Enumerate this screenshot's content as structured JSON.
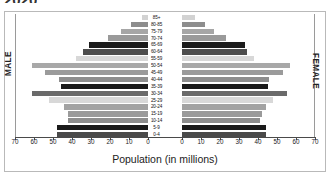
{
  "heading": "2020",
  "panel": {
    "male_label": "MALE",
    "female_label": "FEMALE",
    "x_title": "Population (in millions)"
  },
  "chart_data": {
    "type": "bar",
    "subtype": "population-pyramid",
    "title": "2020",
    "xlabel": "Population (in millions)",
    "ylabel": "",
    "xlim": [
      0,
      70
    ],
    "grid": false,
    "legend": false,
    "left_side_label": "MALE",
    "right_side_label": "FEMALE",
    "x_ticks_left": [
      70,
      60,
      50,
      40,
      30,
      20,
      10,
      0
    ],
    "x_ticks_right": [
      0,
      10,
      20,
      30,
      40,
      50,
      60,
      70
    ],
    "categories": [
      "85+",
      "80-85",
      "75-79",
      "70-74",
      "65-69",
      "60-64",
      "55-59",
      "50-54",
      "45-49",
      "40-44",
      "35-39",
      "30-34",
      "25-29",
      "20-24",
      "15-19",
      "10-14",
      "5-9",
      "0-4"
    ],
    "series": [
      {
        "name": "MALE",
        "side": "left",
        "values": [
          3,
          9,
          14,
          21,
          31,
          34,
          38,
          61,
          54,
          47,
          46,
          61,
          52,
          44,
          42,
          42,
          48,
          48
        ]
      },
      {
        "name": "FEMALE",
        "side": "right",
        "values": [
          7,
          12,
          17,
          23,
          33,
          34,
          38,
          57,
          53,
          46,
          45,
          55,
          48,
          44,
          42,
          41,
          44,
          44
        ]
      }
    ],
    "bar_shades": [
      "#d2d2d2",
      "#8d8d8d",
      "#a6a6a6",
      "#9a9a9a",
      "#1c1c1c",
      "#4e4e4e",
      "#d8d8d8",
      "#a8a8a8",
      "#9b9b9b",
      "#8e8e8e",
      "#1a1a1a",
      "#6a6a6a",
      "#d8d8d8",
      "#a2a2a2",
      "#9a9a9a",
      "#8d8d8d",
      "#1a1a1a",
      "#4a4a4a"
    ]
  }
}
